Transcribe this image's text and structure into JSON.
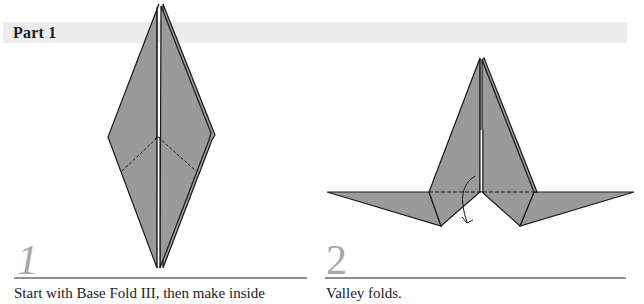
{
  "section": {
    "title": "Part 1"
  },
  "steps": [
    {
      "number": "1",
      "caption": "Start with Base Fold III, then make inside",
      "diagram": "elongated-diamond-with-mountain-fold-lines"
    },
    {
      "number": "2",
      "caption": "Valley folds.",
      "diagram": "spread-wings-with-valley-fold-line-and-arrow"
    }
  ],
  "colors": {
    "paper_fill": "#9a9a9a",
    "outline": "#1a1a1a",
    "header_bar": "#ececec",
    "numeral": "#a8a8a8",
    "divider": "#8f8f8f"
  }
}
